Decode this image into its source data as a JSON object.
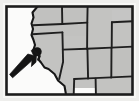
{
  "figure": {
    "kind": "locator-map",
    "title": "Western United States locator map",
    "caption": "",
    "width": 139,
    "height": 101
  },
  "colors": {
    "page_background": "#ffffff",
    "paper": "#f7f7f5",
    "ocean": "#fbfbfa",
    "land_fill": "#c3c3c1",
    "land_fill_shadow": "#b4b4b2",
    "frame_stroke": "#1c1c1c",
    "coast_stroke": "#171717",
    "border_stroke": "#1f1f1f",
    "marker_fill": "#141414",
    "arrow_fill": "#141414",
    "paper_speckle": "#d8d8d6"
  },
  "frame": {
    "name": "map-frame",
    "stroke_width": 3,
    "x": 5,
    "y": 5,
    "width": 129,
    "height": 91
  },
  "marker": {
    "name": "location-marker",
    "label": "",
    "cx": 37,
    "cy": 53,
    "r": 4.6
  },
  "arrow": {
    "name": "pointer-arrow",
    "label": "",
    "tip_x": 36,
    "tip_y": 50,
    "tail_x": 11,
    "tail_y": 76,
    "direction": "northeast"
  },
  "regions": [
    {
      "name": "pacific-ocean",
      "label": ""
    },
    {
      "name": "state-washington",
      "label": ""
    },
    {
      "name": "state-oregon",
      "label": ""
    },
    {
      "name": "state-california",
      "label": ""
    },
    {
      "name": "state-nevada",
      "label": ""
    },
    {
      "name": "state-idaho",
      "label": ""
    },
    {
      "name": "state-montana",
      "label": ""
    },
    {
      "name": "state-wyoming",
      "label": ""
    },
    {
      "name": "state-utah",
      "label": ""
    },
    {
      "name": "state-colorado",
      "label": ""
    },
    {
      "name": "state-arizona",
      "label": ""
    },
    {
      "name": "state-new-mexico",
      "label": ""
    },
    {
      "name": "state-north-dakota",
      "label": ""
    },
    {
      "name": "state-south-dakota",
      "label": ""
    },
    {
      "name": "state-nebraska",
      "label": ""
    }
  ],
  "geometry": {
    "land_outline": "M 37.5 8 L 128.5 8 L 128.5 92.5 L 96 92.5 L 95.5 88 L 74 88 L 73.5 92.5 L 66 92.5 L 64.5 86 L 58 80.5 L 54.5 74 L 48.5 69 L 44.5 67.5 L 41 62.5 L 38.5 59.5 L 39.5 56 L 36.5 53.5 L 33.5 49.5 L 35 45 L 33.5 40 L 31.5 35 L 33 29 L 31.5 23.5 L 33.5 17.5 L 32.5 12.5 L 37.5 8 Z",
    "coast": "M 37.5 8 L 32.5 12.5 L 33.5 17.5 L 31.5 23.5 L 33 29 L 31.5 35 L 33.5 40 L 35 45 L 33.5 49.5 L 36.5 53.5 L 39.5 56 L 38.5 59.5 L 41 62.5 L 44.5 67.5 L 48.5 69 L 54.5 74 L 58 80.5 L 64.5 86 L 66 92.5",
    "internal_borders": [
      "M 37.8 25.5 L 62.5 24.0 L 62.0 8.5",
      "M 32.3 34.0 L 62.5 32.0",
      "M 62.5 24.0 L 87.0 22.5 L 87.5 8.5",
      "M 62.2 32.0 L 63.0 62.0",
      "M 63.0 62.0 L 59.0 79.5",
      "M 62.6 49.5 L 87.0 48.5 L 87.3 22.5",
      "M 87.0 48.5 L 111.5 47.5 L 111.8 22.0",
      "M 111.5 47.5 L 128.5 46.5",
      "M 111.8 22.0 L 128.5 21.0",
      "M 87.2 48.5 L 88.0 78.5 L 111.0 77.5 L 111.5 47.5",
      "M 88.0 78.5 L 74.0 79.0 L 73.6 88.0",
      "M 111.0 77.5 L 128.5 76.5",
      "M 74.0 79.0 L 64.5 79.5"
    ]
  }
}
